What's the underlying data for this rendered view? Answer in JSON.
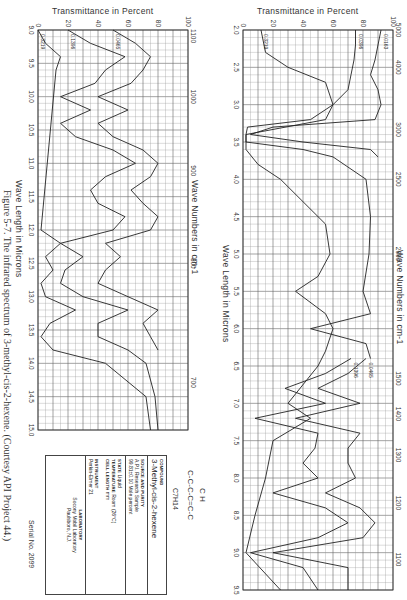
{
  "document": {
    "figure_caption": "Figure 5-7. The infrared spectrum of 3-methyl-cis-2-hexene. (Courtesy API Project 44.)",
    "serial": "Serial No. 2099",
    "formula": "C7H14",
    "structure": "C-C-C-C=C-C",
    "structure_branch": "C H"
  },
  "info_box": {
    "compound_label": "COMPOUND",
    "compound": "3-Methyl-cis-2-hexene",
    "source_label": "SOURCE AND PURITY",
    "source": "A.P.I. Research Sample",
    "purity": "99.81±0.10 Mole percent",
    "state_label": "STATE",
    "state": "Liquid",
    "temperature_label": "TEMPERATURE",
    "temperature": "Room (26°C)",
    "cell_label": "CELL LENGTH",
    "cell": "mm",
    "instrument_label": "INSTRUMENT",
    "instrument": "Perkin-Elmer 21",
    "laboratory_label": "LABORATORY",
    "laboratory": "Socony Mobil Laboratory",
    "location": "Paulsboro, N.J."
  },
  "chart_data": [
    {
      "type": "line",
      "title": "Infrared spectrum 2.0–9.5 microns",
      "xlabel": "Wave Length in Microns",
      "x2label": "Wave Numbers in cm-1",
      "ylabel": "Transmittance in Percent",
      "x_ticks": [
        "2.0",
        "2.5",
        "3.0",
        "3.5",
        "4.0",
        "4.5",
        "5.0",
        "5.5",
        "6.0",
        "6.5",
        "7.0",
        "7.5",
        "8.0",
        "8.5",
        "9.0",
        "9.5"
      ],
      "x2_ticks": [
        "5000",
        "4000",
        "3000",
        "2500",
        "2000",
        "1500",
        "1400",
        "1300",
        "1200",
        "1100"
      ],
      "y_ticks": [
        "0",
        "20",
        "40",
        "60",
        "80",
        "100"
      ],
      "xlim": [
        2.0,
        9.5
      ],
      "ylim": [
        0,
        100
      ],
      "grid": true,
      "series": [
        {
          "name": "0.0163",
          "x": [
            2.0,
            2.2,
            2.4,
            2.6,
            2.8,
            3.0,
            3.2,
            3.3,
            3.4,
            3.5,
            3.6,
            3.7
          ],
          "values": [
            92,
            90,
            88,
            85,
            90,
            92,
            88,
            20,
            5,
            40,
            85,
            90
          ]
        },
        {
          "name": "0.0396",
          "x": [
            2.0,
            2.2,
            2.4,
            2.6,
            2.8,
            3.0,
            3.2,
            3.3,
            3.4,
            3.5,
            3.6,
            3.7,
            4.0,
            4.5,
            5.0,
            5.5,
            5.8,
            6.0,
            6.2,
            6.4
          ],
          "values": [
            75,
            75,
            74,
            72,
            70,
            60,
            45,
            3,
            2,
            2,
            40,
            60,
            82,
            85,
            84,
            80,
            85,
            45,
            82,
            85
          ]
        },
        {
          "name": "0.3219",
          "x": [
            2.0,
            2.3,
            2.5,
            2.7,
            3.0,
            3.2,
            3.4,
            3.6,
            3.8,
            4.0,
            4.3,
            4.6,
            5.0,
            5.3,
            5.5,
            5.8,
            6.0,
            6.3,
            6.5,
            7.0,
            7.2,
            7.5,
            8.0,
            8.5,
            9.0,
            9.5
          ],
          "values": [
            12,
            15,
            30,
            55,
            60,
            55,
            2,
            2,
            10,
            25,
            40,
            55,
            58,
            50,
            35,
            55,
            60,
            55,
            50,
            30,
            45,
            20,
            15,
            8,
            2,
            25
          ]
        },
        {
          "name": "0.0465",
          "x": [
            6.4,
            6.6,
            6.8,
            7.0,
            7.2,
            7.4,
            7.6,
            7.8,
            8.0,
            8.2,
            8.4,
            8.6,
            8.8,
            9.0,
            9.2,
            9.5
          ],
          "values": [
            82,
            70,
            50,
            78,
            35,
            78,
            70,
            70,
            75,
            55,
            78,
            88,
            80,
            20,
            70,
            70
          ]
        },
        {
          "name": "0.1396",
          "x": [
            6.4,
            6.6,
            6.8,
            7.0,
            7.2,
            7.4,
            7.6,
            7.8,
            8.0,
            8.2,
            8.4,
            8.6,
            8.8,
            9.0,
            9.2,
            9.5
          ],
          "values": [
            72,
            55,
            28,
            55,
            8,
            50,
            48,
            40,
            50,
            20,
            55,
            70,
            50,
            5,
            40,
            50
          ]
        }
      ]
    },
    {
      "type": "line",
      "title": "Infrared spectrum 9.0–15.0 microns",
      "xlabel": "Wave Length in Microns",
      "x2label": "Wave Numbers in cm-1",
      "ylabel": "Transmittance in Percent",
      "x_ticks": [
        "9.0",
        "9.5",
        "10.0",
        "10.5",
        "11.0",
        "11.5",
        "12.0",
        "12.5",
        "13.0",
        "13.5",
        "14.0",
        "14.5",
        "15.0"
      ],
      "x2_ticks": [
        "1100",
        "1000",
        "900",
        "800",
        "700"
      ],
      "y_ticks": [
        "0",
        "20",
        "40",
        "60",
        "80",
        "100"
      ],
      "xlim": [
        9.0,
        15.0
      ],
      "ylim": [
        0,
        100
      ],
      "grid": true,
      "series": [
        {
          "name": "0.0465",
          "x": [
            9.0,
            9.2,
            9.4,
            9.6,
            9.8,
            10.0,
            10.2,
            10.4,
            10.6,
            10.8,
            11.0,
            11.2,
            11.4,
            11.6,
            11.8,
            12.0,
            12.2,
            12.4,
            12.6,
            12.8,
            13.0,
            13.2,
            13.4,
            13.6,
            13.8
          ],
          "values": [
            50,
            65,
            75,
            70,
            62,
            40,
            60,
            40,
            50,
            70,
            80,
            75,
            62,
            70,
            80,
            75,
            45,
            55,
            45,
            40,
            60,
            80,
            70,
            75,
            80
          ]
        },
        {
          "name": "0.1396",
          "x": [
            9.0,
            9.2,
            9.4,
            9.6,
            9.8,
            10.0,
            10.2,
            10.4,
            10.6,
            10.8,
            11.0,
            11.2,
            11.4,
            11.6,
            11.8,
            12.0,
            12.2,
            12.4,
            12.6,
            12.8,
            13.0,
            13.2,
            13.4,
            13.6,
            13.8,
            14.0,
            14.5,
            15.0
          ],
          "values": [
            20,
            35,
            58,
            45,
            38,
            15,
            35,
            15,
            25,
            50,
            65,
            45,
            35,
            40,
            58,
            50,
            15,
            30,
            18,
            15,
            30,
            60,
            40,
            40,
            60,
            72,
            78,
            80
          ]
        },
        {
          "name": "0.3219",
          "x": [
            9.0,
            9.2,
            9.4,
            9.6,
            12.0,
            12.2,
            12.4,
            12.6,
            12.8,
            13.0,
            13.2,
            13.4,
            13.6,
            13.8,
            14.0,
            14.5,
            15.0
          ],
          "values": [
            0,
            5,
            15,
            12,
            2,
            15,
            5,
            10,
            2,
            5,
            25,
            8,
            2,
            10,
            45,
            72,
            75
          ]
        }
      ]
    }
  ],
  "panel1": {
    "y_title": "Transmittance in Percent",
    "x_title": "Wave Length in Microns",
    "top_title": "Wave Numbers in cm-1",
    "y_ticks": [
      "0",
      "20",
      "40",
      "60",
      "80",
      "100"
    ],
    "x_ticks": [
      "2.0",
      "2.5",
      "3.0",
      "3.5",
      "4.0",
      "4.5",
      "5.0",
      "5.5",
      "6.0",
      "6.5",
      "7.0",
      "7.5",
      "8.0",
      "8.5",
      "9.0",
      "9.5"
    ],
    "wn_ticks": [
      "5000",
      "4000",
      "3000",
      "2500",
      "2000",
      "1500",
      "1400",
      "1300",
      "1200",
      "1100"
    ]
  },
  "panel2": {
    "y_title": "Transmittance in Percent",
    "x_title": "Wave Length in Microns",
    "top_title": "Wave Numbers in cm-1",
    "y_ticks": [
      "0",
      "20",
      "40",
      "60",
      "80",
      "100"
    ],
    "x_ticks": [
      "9.0",
      "9.5",
      "10.0",
      "10.5",
      "11.0",
      "11.5",
      "12.0",
      "12.5",
      "13.0",
      "13.5",
      "14.0",
      "14.5",
      "15.0"
    ],
    "wn_ticks": [
      "1100",
      "1000",
      "900",
      "800",
      "700"
    ]
  }
}
